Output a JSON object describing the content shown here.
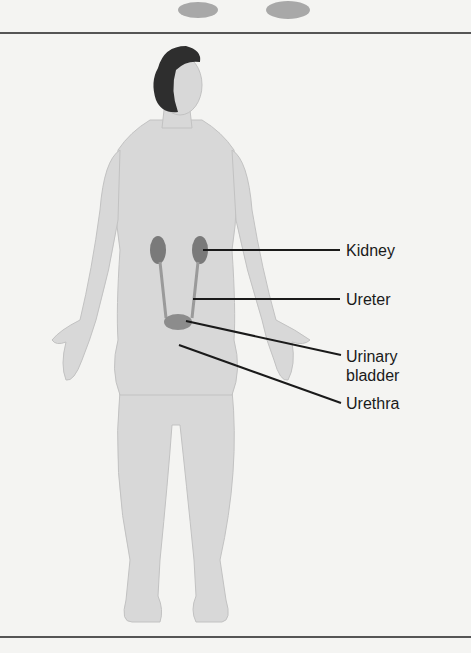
{
  "figure": {
    "labels": [
      {
        "id": "kidney",
        "text": "Kidney"
      },
      {
        "id": "ureter",
        "text": "Ureter"
      },
      {
        "id": "urinary-bladder",
        "text": "Urinary bladder"
      },
      {
        "id": "urethra",
        "text": "Urethra"
      }
    ]
  },
  "colors": {
    "background": "#f4f4f2",
    "skin": "#d6d6d6",
    "skin_shade": "#bdbdbd",
    "hair": "#2e2e2e",
    "organ": "#7a7a7a",
    "leader_line": "#1a1a1a",
    "rule": "#555555"
  }
}
